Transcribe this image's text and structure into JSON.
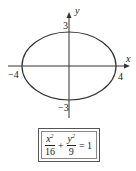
{
  "diagram": {
    "type": "ellipse-graph",
    "axes": {
      "x_label": "x",
      "y_label": "y"
    },
    "ellipse": {
      "a": 4,
      "b": 3,
      "center": [
        0,
        0
      ]
    },
    "tick_labels": {
      "x_neg": "−4",
      "x_pos": "4",
      "y_pos": "3",
      "y_neg": "−3"
    },
    "equation": {
      "term1_num": "x",
      "term1_exp": "2",
      "term1_den": "16",
      "plus": "+",
      "term2_num": "y",
      "term2_exp": "2",
      "term2_den": "9",
      "rhs": "= 1"
    },
    "colors": {
      "stroke": "#333333"
    }
  }
}
